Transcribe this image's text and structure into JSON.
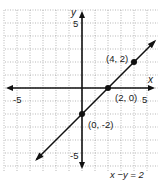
{
  "chart_data": {
    "type": "line",
    "title": "",
    "equation": "x −y = 2",
    "xlabel": "x",
    "ylabel": "y",
    "xlim": [
      -6,
      6
    ],
    "ylim": [
      -6,
      6
    ],
    "grid": true,
    "x_ticks_labeled": [
      -5,
      5
    ],
    "y_ticks_labeled": [
      5,
      -5
    ],
    "tick_labels": {
      "x_neg": "-5",
      "x_pos": "5",
      "y_pos": "5",
      "y_neg": "-5"
    },
    "series": [
      {
        "name": "x - y = 2",
        "slope": 1,
        "intercept": -2,
        "x_range": [
          -3.5,
          5.6
        ]
      }
    ],
    "points": [
      {
        "x": 4,
        "y": 2,
        "label": "(4, 2)"
      },
      {
        "x": 2,
        "y": 0,
        "label": "(2, 0)"
      },
      {
        "x": 0,
        "y": -2,
        "label": "(0, -2)"
      }
    ]
  }
}
